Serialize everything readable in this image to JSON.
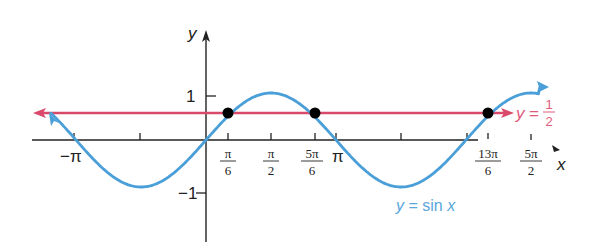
{
  "chart_data": {
    "type": "line",
    "title": "",
    "xlabel": "x",
    "ylabel": "y",
    "xlim": [
      -4.2,
      8.2
    ],
    "ylim": [
      -1.6,
      2.3
    ],
    "grid": false,
    "colors": {
      "sine": "#4a9fd8",
      "half": "#d9496a",
      "axis": "#222222",
      "points": "#000000"
    },
    "x_ticks": [
      {
        "value": -3.14159,
        "label": "−π"
      },
      {
        "value": -1.5708,
        "label": ""
      },
      {
        "value": 0.5236,
        "label_num": "π",
        "label_den": "6"
      },
      {
        "value": 1.5708,
        "label_num": "π",
        "label_den": "2"
      },
      {
        "value": 2.618,
        "label_num": "5π",
        "label_den": "6"
      },
      {
        "value": 3.14159,
        "label": "π"
      },
      {
        "value": 4.7124,
        "label": ""
      },
      {
        "value": 6.2832,
        "label": ""
      },
      {
        "value": 6.8068,
        "label_num": "13π",
        "label_den": "6"
      },
      {
        "value": 7.854,
        "label_num": "5π",
        "label_den": "2"
      }
    ],
    "y_ticks": [
      {
        "value": 1,
        "label": "1"
      },
      {
        "value": 0.5,
        "label": ""
      },
      {
        "value": -1,
        "label": "−1"
      }
    ],
    "series": [
      {
        "name": "y = sin x",
        "function": "sin(x)",
        "x_range": [
          -3.8,
          8.2
        ],
        "arrows": "both"
      },
      {
        "name": "y = 1/2",
        "function": "0.5",
        "x_range": [
          -4.2,
          7.4
        ],
        "arrows": "both"
      }
    ],
    "intersection_points": [
      {
        "x": 0.5236,
        "y": 0.5,
        "label": "π/6"
      },
      {
        "x": 2.618,
        "y": 0.5,
        "label": "5π/6"
      },
      {
        "x": 6.8068,
        "y": 0.5,
        "label": "13π/6"
      }
    ],
    "annotations": {
      "sine_label": "y = sin x",
      "half_label_prefix": "y",
      "half_label_eq": "=",
      "half_label_num": "1",
      "half_label_den": "2"
    }
  }
}
